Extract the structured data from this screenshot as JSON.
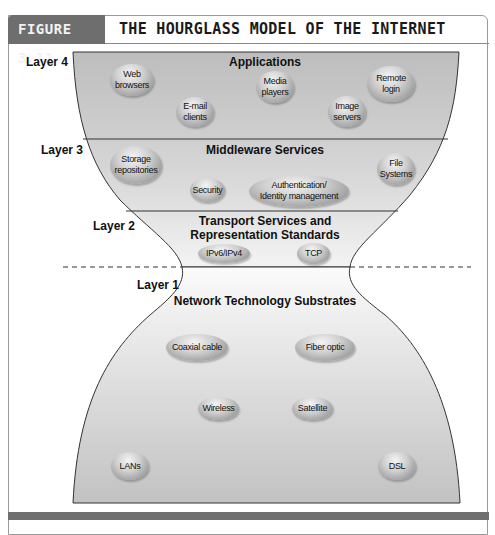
{
  "figure": {
    "number": "FIGURE 3.11",
    "title": "THE HOURGLASS MODEL OF THE INTERNET"
  },
  "colors": {
    "header_tag": "#6e6e6e",
    "region_fill": "#c6c6c6",
    "outline": "#333333",
    "bottom_band": "#6f6f6f"
  },
  "layers": [
    {
      "label": "Layer 4",
      "title": "Applications",
      "items": [
        "Web browsers",
        "E-mail clients",
        "Media players",
        "Image servers",
        "Remote login"
      ]
    },
    {
      "label": "Layer 3",
      "title": "Middleware Services",
      "items": [
        "Storage repositories",
        "Security",
        "Authentication/ Identity management",
        "File Systems"
      ]
    },
    {
      "label": "Layer 2",
      "title_line1": "Transport Services and",
      "title_line2": "Representation Standards",
      "items": [
        "IPv6/IPv4",
        "TCP"
      ]
    },
    {
      "label": "Layer 1",
      "title": "Network Technology Substrates",
      "items": [
        "Coaxial cable",
        "Fiber optic",
        "Wireless",
        "Satellite",
        "LANs",
        "DSL"
      ]
    }
  ],
  "bubbles": {
    "web_browsers": [
      "Web",
      "browsers"
    ],
    "email_clients": [
      "E-mail",
      "clients"
    ],
    "media_players": [
      "Media",
      "players"
    ],
    "image_servers": [
      "Image",
      "servers"
    ],
    "remote_login": [
      "Remote",
      "login"
    ],
    "storage_repositories": [
      "Storage",
      "repositories"
    ],
    "security": [
      "Security"
    ],
    "auth_identity": [
      "Authentication/",
      "Identity management"
    ],
    "file_systems": [
      "File",
      "Systems"
    ],
    "ipv6_ipv4": [
      "IPv6/IPv4"
    ],
    "tcp": [
      "TCP"
    ],
    "coaxial_cable": [
      "Coaxial cable"
    ],
    "fiber_optic": [
      "Fiber optic"
    ],
    "wireless": [
      "Wireless"
    ],
    "satellite": [
      "Satellite"
    ],
    "lans": [
      "LANs"
    ],
    "dsl": [
      "DSL"
    ]
  }
}
